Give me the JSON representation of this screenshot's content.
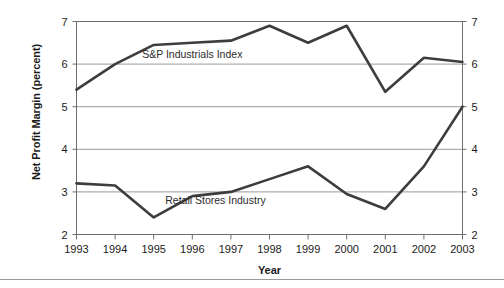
{
  "chart_data": {
    "type": "line",
    "title": "",
    "xlabel": "Year",
    "ylabel": "Net Profit Margin (percent)",
    "categories": [
      "1993",
      "1994",
      "1995",
      "1996",
      "1997",
      "1998",
      "1999",
      "2000",
      "2001",
      "2002",
      "2003"
    ],
    "x": [
      1993,
      1994,
      1995,
      1996,
      1997,
      1998,
      1999,
      2000,
      2001,
      2002,
      2003
    ],
    "xlim": [
      1993,
      2003
    ],
    "ylim": [
      2,
      7
    ],
    "yticks": [
      2,
      3,
      4,
      5,
      6,
      7
    ],
    "ytick_labels_left": [
      "2",
      "3",
      "4",
      "5",
      "6",
      "7"
    ],
    "ytick_labels_right": [
      "2",
      "3",
      "4",
      "5",
      "6",
      "7"
    ],
    "grid": "horizontal",
    "gridlines_at": [
      3,
      4,
      5,
      6
    ],
    "legend": "inline-labels",
    "line_color": "#3d3d3d",
    "grid_color": "#9a9a9a",
    "axis_color": "#6e6e6e",
    "series": [
      {
        "name": "S&P Industrials Index",
        "label_x": 1996.0,
        "label_y": 6.15,
        "values": [
          5.4,
          6.0,
          6.45,
          6.5,
          6.55,
          6.9,
          6.5,
          6.9,
          5.35,
          6.15,
          6.05
        ]
      },
      {
        "name": "Retail Stores Industry",
        "label_x": 1996.6,
        "label_y": 2.72,
        "values": [
          3.2,
          3.15,
          2.4,
          2.9,
          3.0,
          3.3,
          3.6,
          2.95,
          2.6,
          3.6,
          5.0
        ]
      }
    ]
  }
}
